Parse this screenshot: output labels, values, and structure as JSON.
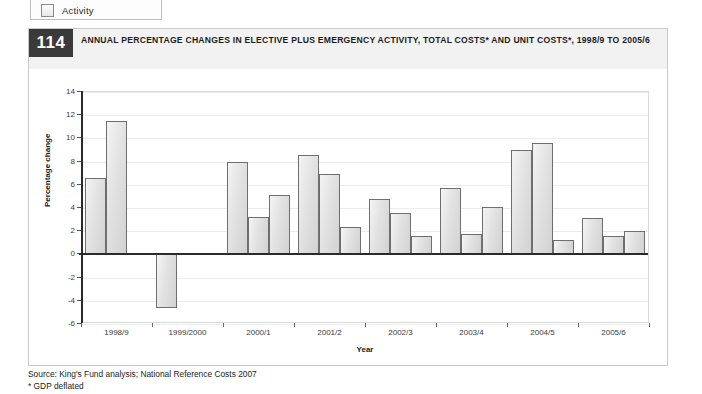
{
  "legend": {
    "items": [
      {
        "label": "Activity",
        "icon": "square-swatch-icon"
      }
    ]
  },
  "figure": {
    "number": "114",
    "title": "ANNUAL PERCENTAGE CHANGES IN ELECTIVE PLUS EMERGENCY ACTIVITY, TOTAL COSTS* AND UNIT COSTS*, 1998/9 TO 2005/6"
  },
  "footer": {
    "source": "Source: King's Fund analysis; National Reference Costs 2007",
    "note": "* GDP deflated"
  },
  "chart_data": {
    "type": "bar",
    "title": "ANNUAL PERCENTAGE CHANGES IN ELECTIVE PLUS EMERGENCY ACTIVITY, TOTAL COSTS* AND UNIT COSTS*, 1998/9 TO 2005/6",
    "xlabel": "Year",
    "ylabel": "Percentage change",
    "ylim": [
      -6,
      14
    ],
    "yticks": [
      14,
      12,
      10,
      8,
      6,
      4,
      2,
      0,
      -2,
      -4,
      -6
    ],
    "grid": true,
    "legend_position": "above-figure",
    "bar_fill": "#e2e2e2",
    "bar_stroke": "#6e6e6e",
    "categories": [
      "1998/9",
      "1999/2000",
      "2000/1",
      "2001/2",
      "2002/3",
      "2003/4",
      "2004/5",
      "2005/6"
    ],
    "series": [
      {
        "name": "Activity",
        "values": [
          6.6,
          null,
          8.0,
          8.6,
          4.8,
          5.7,
          9.0,
          3.1
        ]
      },
      {
        "name": "Total costs",
        "values": [
          11.5,
          null,
          3.2,
          6.9,
          3.6,
          1.8,
          9.6,
          1.6
        ]
      },
      {
        "name": "Unit costs",
        "values": [
          null,
          -4.6,
          5.1,
          2.4,
          1.6,
          4.1,
          1.2,
          2.0
        ]
      }
    ],
    "bars": [
      {
        "group": "1998/9",
        "slot": 0,
        "value": 6.6
      },
      {
        "group": "1998/9",
        "slot": 1,
        "value": 11.5
      },
      {
        "group": "1999/2000",
        "slot": 0,
        "value": -4.6
      },
      {
        "group": "2000/1",
        "slot": 0,
        "value": 8.0
      },
      {
        "group": "2000/1",
        "slot": 1,
        "value": 3.2
      },
      {
        "group": "2000/1",
        "slot": 2,
        "value": 5.1
      },
      {
        "group": "2001/2",
        "slot": 0,
        "value": 8.6
      },
      {
        "group": "2001/2",
        "slot": 1,
        "value": 6.9
      },
      {
        "group": "2001/2",
        "slot": 2,
        "value": 2.4
      },
      {
        "group": "2002/3",
        "slot": 0,
        "value": 4.8
      },
      {
        "group": "2002/3",
        "slot": 1,
        "value": 3.6
      },
      {
        "group": "2002/3",
        "slot": 2,
        "value": 1.6
      },
      {
        "group": "2003/4",
        "slot": 0,
        "value": 5.7
      },
      {
        "group": "2003/4",
        "slot": 1,
        "value": 1.8
      },
      {
        "group": "2003/4",
        "slot": 2,
        "value": 4.1
      },
      {
        "group": "2004/5",
        "slot": 0,
        "value": 9.0
      },
      {
        "group": "2004/5",
        "slot": 1,
        "value": 9.6
      },
      {
        "group": "2004/5",
        "slot": 2,
        "value": 1.2
      },
      {
        "group": "2005/6",
        "slot": 0,
        "value": 3.1
      },
      {
        "group": "2005/6",
        "slot": 1,
        "value": 1.6
      },
      {
        "group": "2005/6",
        "slot": 2,
        "value": 2.0
      }
    ]
  }
}
